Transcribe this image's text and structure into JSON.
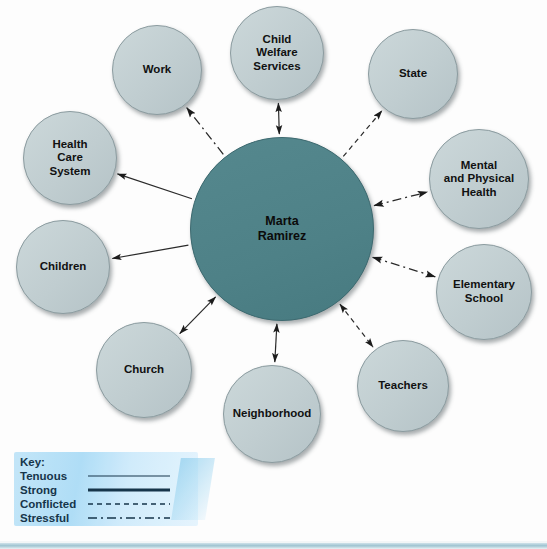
{
  "diagram": {
    "type": "ecomap",
    "center": {
      "id": "center",
      "label": "Marta\nRamirez",
      "line1": "Marta",
      "line2": "Ramirez",
      "color": "#4f8288",
      "cx": 282,
      "cy": 229,
      "r": 92
    },
    "node_color": "#c2cfd2",
    "node_border": "#8c9ca0",
    "nodes": [
      {
        "id": "work",
        "label": "Work",
        "lines": [
          "Work"
        ],
        "cx": 157,
        "cy": 70,
        "r": 45,
        "relationship": "stressful",
        "direction": "to-node"
      },
      {
        "id": "child-welfare-services",
        "label": "Child Welfare Services",
        "lines": [
          "Child",
          "Welfare",
          "Services"
        ],
        "cx": 277,
        "cy": 53,
        "r": 47,
        "relationship": "tenuous",
        "direction": "both"
      },
      {
        "id": "state",
        "label": "State",
        "lines": [
          "State"
        ],
        "cx": 413,
        "cy": 74,
        "r": 45,
        "relationship": "conflicted",
        "direction": "to-node"
      },
      {
        "id": "health-care-system",
        "label": "Health Care System",
        "lines": [
          "Health",
          "Care",
          "System"
        ],
        "cx": 70,
        "cy": 158,
        "r": 47,
        "relationship": "tenuous",
        "direction": "to-node"
      },
      {
        "id": "mental-and-physical-health",
        "label": "Mental and Physical Health",
        "lines": [
          "Mental",
          "and Physical",
          "Health"
        ],
        "cx": 479,
        "cy": 179,
        "r": 50,
        "relationship": "stressful",
        "direction": "both"
      },
      {
        "id": "children",
        "label": "Children",
        "lines": [
          "Children"
        ],
        "cx": 63,
        "cy": 267,
        "r": 47,
        "relationship": "tenuous",
        "direction": "to-node"
      },
      {
        "id": "elementary-school",
        "label": "Elementary School",
        "lines": [
          "Elementary",
          "School"
        ],
        "cx": 484,
        "cy": 292,
        "r": 48,
        "relationship": "stressful",
        "direction": "both"
      },
      {
        "id": "church",
        "label": "Church",
        "lines": [
          "Church"
        ],
        "cx": 144,
        "cy": 370,
        "r": 48,
        "relationship": "tenuous",
        "direction": "both"
      },
      {
        "id": "teachers",
        "label": "Teachers",
        "lines": [
          "Teachers"
        ],
        "cx": 403,
        "cy": 386,
        "r": 46,
        "relationship": "conflicted",
        "direction": "both"
      },
      {
        "id": "neighborhood",
        "label": "Neighborhood",
        "lines": [
          "Neighborhood"
        ],
        "cx": 272,
        "cy": 414,
        "r": 49,
        "relationship": "tenuous",
        "direction": "both"
      }
    ]
  },
  "legend": {
    "title": "Key:",
    "items": [
      {
        "label": "Tenuous",
        "style": "thin-solid"
      },
      {
        "label": "Strong",
        "style": "thick-solid"
      },
      {
        "label": "Conflicted",
        "style": "dashed"
      },
      {
        "label": "Stressful",
        "style": "dash-dot"
      }
    ]
  }
}
